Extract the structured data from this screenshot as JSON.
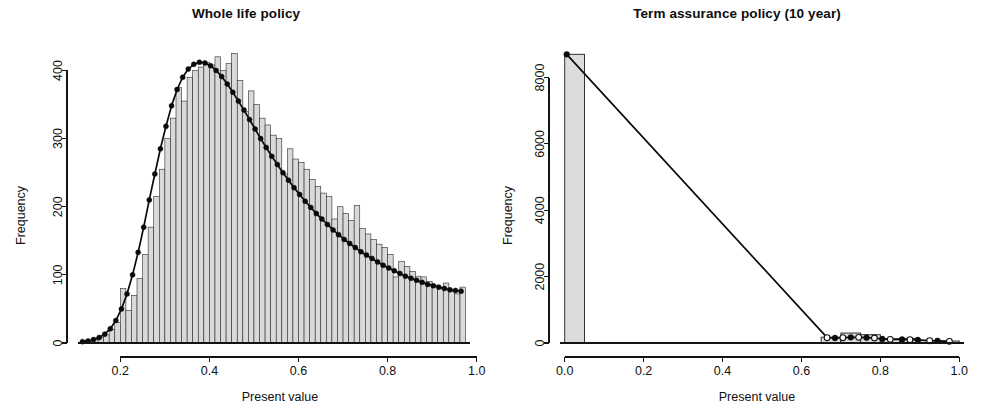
{
  "figure": {
    "width": 985,
    "height": 418,
    "background": "#ffffff",
    "ink_color": "#101010",
    "bar_fill": "#d9d9d9",
    "bar_stroke": "#2b2b2b",
    "curve_color": "#0a0a0a"
  },
  "panels": [
    {
      "id": "left",
      "title": "Whole life policy"
    },
    {
      "id": "right",
      "title": "Term assurance policy (10 year)"
    }
  ],
  "labels": {
    "xlabel": "Present value",
    "ylabel": "Frequency"
  },
  "chart_data": [
    {
      "type": "bar",
      "title": "Whole life policy",
      "xlabel": "Present value",
      "ylabel": "Frequency",
      "xlim": [
        0.105,
        0.985
      ],
      "ylim": [
        0,
        430
      ],
      "xticks": [
        "0.2",
        "0.4",
        "0.6",
        "0.8",
        "1.0"
      ],
      "xtick_values": [
        0.2,
        0.4,
        0.6,
        0.8,
        1.0
      ],
      "yticks": [
        "0",
        "100",
        "200",
        "300",
        "400"
      ],
      "ytick_values": [
        0,
        100,
        200,
        300,
        400
      ],
      "grid": false,
      "legend": "none",
      "bin_width": 0.0125,
      "bin_starts": [
        0.1125,
        0.125,
        0.1375,
        0.15,
        0.1625,
        0.175,
        0.1875,
        0.2,
        0.2125,
        0.225,
        0.2375,
        0.25,
        0.2625,
        0.275,
        0.2875,
        0.3,
        0.3125,
        0.325,
        0.3375,
        0.35,
        0.3625,
        0.375,
        0.3875,
        0.4,
        0.4125,
        0.425,
        0.4375,
        0.45,
        0.4625,
        0.475,
        0.4875,
        0.5,
        0.5125,
        0.525,
        0.5375,
        0.55,
        0.5625,
        0.575,
        0.5875,
        0.6,
        0.6125,
        0.625,
        0.6375,
        0.65,
        0.6625,
        0.675,
        0.6875,
        0.7,
        0.7125,
        0.725,
        0.7375,
        0.75,
        0.7625,
        0.775,
        0.7875,
        0.8,
        0.8125,
        0.825,
        0.8375,
        0.85,
        0.8625,
        0.875,
        0.8875,
        0.9,
        0.9125,
        0.925,
        0.9375,
        0.95,
        0.9625
      ],
      "values": [
        2,
        3,
        5,
        8,
        12,
        20,
        30,
        80,
        48,
        70,
        95,
        130,
        170,
        215,
        255,
        300,
        330,
        375,
        355,
        390,
        400,
        405,
        412,
        408,
        420,
        400,
        410,
        425,
        385,
        340,
        370,
        350,
        330,
        320,
        305,
        300,
        248,
        285,
        270,
        265,
        255,
        240,
        230,
        220,
        215,
        182,
        200,
        190,
        180,
        202,
        168,
        160,
        152,
        145,
        140,
        130,
        97,
        120,
        112,
        105,
        98,
        97,
        90,
        85,
        80,
        88,
        76,
        72,
        82
      ],
      "series": [
        {
          "name": "fitted density",
          "type": "line-with-markers",
          "marker": "filled-circle",
          "x": [
            0.115,
            0.1275,
            0.14,
            0.1525,
            0.165,
            0.1775,
            0.19,
            0.2025,
            0.215,
            0.2275,
            0.24,
            0.2525,
            0.265,
            0.2775,
            0.29,
            0.3025,
            0.315,
            0.3275,
            0.34,
            0.3525,
            0.365,
            0.3775,
            0.39,
            0.4025,
            0.415,
            0.4275,
            0.44,
            0.4525,
            0.465,
            0.4775,
            0.49,
            0.5025,
            0.515,
            0.5275,
            0.54,
            0.5525,
            0.565,
            0.5775,
            0.59,
            0.6025,
            0.615,
            0.6275,
            0.64,
            0.6525,
            0.665,
            0.6775,
            0.69,
            0.7025,
            0.715,
            0.7275,
            0.74,
            0.7525,
            0.765,
            0.7775,
            0.79,
            0.8025,
            0.815,
            0.8275,
            0.84,
            0.8525,
            0.865,
            0.8775,
            0.89,
            0.9025,
            0.915,
            0.9275,
            0.94,
            0.9525,
            0.965
          ],
          "y": [
            2,
            3,
            5,
            8,
            13,
            21,
            33,
            50,
            72,
            100,
            133,
            170,
            210,
            248,
            285,
            318,
            348,
            372,
            390,
            402,
            409,
            412,
            411,
            407,
            400,
            391,
            380,
            368,
            355,
            342,
            328,
            314,
            300,
            287,
            274,
            262,
            250,
            239,
            228,
            218,
            208,
            199,
            190,
            182,
            174,
            166,
            159,
            152,
            146,
            140,
            134,
            129,
            124,
            119,
            114,
            110,
            106,
            102,
            98,
            95,
            92,
            89,
            86,
            84,
            82,
            80,
            78,
            77,
            76
          ]
        }
      ]
    },
    {
      "type": "bar",
      "title": "Term assurance policy (10 year)",
      "xlabel": "Present value",
      "ylabel": "Frequency",
      "xlim": [
        -0.012,
        1.012
      ],
      "ylim": [
        0,
        8950
      ],
      "xticks": [
        "0.0",
        "0.2",
        "0.4",
        "0.6",
        "0.8",
        "1.0"
      ],
      "xtick_values": [
        0.0,
        0.2,
        0.4,
        0.6,
        0.8,
        1.0
      ],
      "yticks": [
        "0",
        "2000",
        "4000",
        "6000",
        "8000"
      ],
      "ytick_values": [
        0,
        2000,
        4000,
        6000,
        8000
      ],
      "grid": false,
      "legend": "none",
      "bin_width": 0.05,
      "bin_starts": [
        0.0,
        0.65,
        0.7,
        0.75,
        0.8,
        0.85,
        0.9,
        0.95
      ],
      "values": [
        8700,
        175,
        300,
        250,
        130,
        140,
        80,
        60
      ],
      "series": [
        {
          "name": "fitted density",
          "type": "line-with-markers",
          "marker": "mixed-circle",
          "x": [
            0.005,
            0.665,
            0.685,
            0.705,
            0.725,
            0.745,
            0.765,
            0.785,
            0.805,
            0.825,
            0.855,
            0.875,
            0.895,
            0.925,
            0.945,
            0.975
          ],
          "y": [
            8700,
            160,
            150,
            160,
            170,
            170,
            160,
            150,
            120,
            110,
            105,
            100,
            90,
            70,
            65,
            50
          ]
        }
      ]
    }
  ]
}
